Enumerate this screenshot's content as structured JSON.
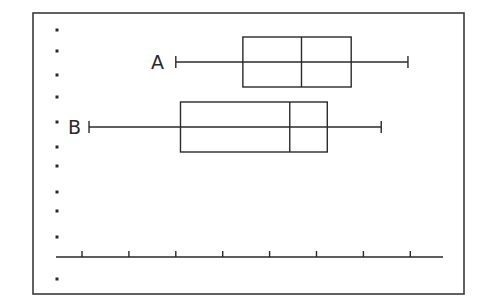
{
  "chart_data": {
    "type": "boxplot",
    "title": "",
    "xlabel": "",
    "ylabel": "",
    "orientation": "horizontal",
    "x_ticks": [
      1,
      2,
      3,
      4,
      5,
      6,
      7,
      8
    ],
    "x_tick_labels": [],
    "xlim": [
      0.5,
      8.7
    ],
    "grid": false,
    "legend": null,
    "series": [
      {
        "name": "A",
        "min": 3.0,
        "q1": 4.43,
        "median": 5.68,
        "q3": 6.74,
        "max": 7.95
      },
      {
        "name": "B",
        "min": 1.15,
        "q1": 3.1,
        "median": 5.43,
        "q3": 6.23,
        "max": 7.38
      }
    ]
  },
  "style": {
    "line_color": "#2a2a2a",
    "frame_color": "#3a3a3a",
    "background": "#ffffff"
  },
  "layout": {
    "frame": {
      "x": 33,
      "y": 13,
      "w": 431,
      "h": 281
    },
    "axis": {
      "y": 257,
      "x0": 56,
      "x1": 443
    },
    "tick_px": {
      "first_value": 1,
      "first_x": 82,
      "spacing": 46.9
    },
    "boxes": [
      {
        "name": "A",
        "cy": 62,
        "half_h": 25,
        "label_x": 151
      },
      {
        "name": "B",
        "cy": 127,
        "half_h": 25,
        "label_x": 68
      }
    ],
    "left_dots_x": 57,
    "left_dots_y": [
      30,
      51,
      75,
      97,
      122,
      147,
      166,
      192,
      211,
      237,
      279
    ]
  }
}
